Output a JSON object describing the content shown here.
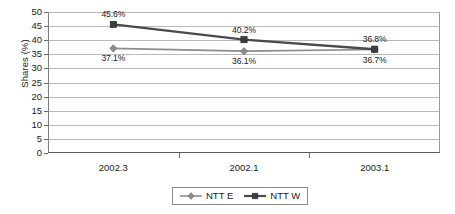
{
  "chart_data": {
    "type": "line",
    "title": "",
    "xlabel": "",
    "ylabel": "Shares (%)",
    "categories": [
      "2002.3",
      "2002.1",
      "2003.1"
    ],
    "ylim": [
      0,
      50
    ],
    "ytick_step": 5,
    "yticks": [
      "50",
      "45",
      "40",
      "35",
      "30",
      "25",
      "20",
      "15",
      "10",
      "5",
      "0"
    ],
    "grid": true,
    "legend_position": "bottom",
    "series": [
      {
        "name": "NTT E",
        "marker": "diamond",
        "color": "#8c8c8c",
        "values": [
          37.1,
          36.1,
          36.7
        ],
        "labels": [
          "37.1%",
          "36.1%",
          "36.7%"
        ],
        "label_position": "below"
      },
      {
        "name": "NTT W",
        "marker": "square",
        "color": "#4a4a4a",
        "values": [
          45.6,
          40.2,
          36.8
        ],
        "labels": [
          "45.6%",
          "40.2%",
          "36.8%"
        ],
        "label_position": "above"
      }
    ]
  },
  "axis": {
    "y_title": "Shares (%)"
  },
  "legend": {
    "items": [
      {
        "label": "NTT E",
        "marker": "diamond-marker-icon"
      },
      {
        "label": "NTT W",
        "marker": "square-marker-icon"
      }
    ]
  }
}
